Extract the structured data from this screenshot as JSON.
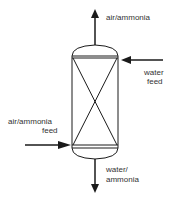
{
  "diagram": {
    "vessel": {
      "type": "packed column with crossed internals"
    },
    "streams": [
      {
        "id": "top_outlet",
        "label": "air/ammonia",
        "direction": "out",
        "position": "top"
      },
      {
        "id": "water_feed",
        "label_line1": "water",
        "label_line2": "feed",
        "direction": "in",
        "position": "upper-right"
      },
      {
        "id": "gas_feed",
        "label_line1": "air/ammonia",
        "label_line2": "feed",
        "direction": "in",
        "position": "lower-left"
      },
      {
        "id": "bottom_outlet",
        "label_line1": "water/",
        "label_line2": "ammonia",
        "direction": "out",
        "position": "bottom"
      }
    ],
    "colors": {
      "line": "#1a1a1a",
      "text": "#333333",
      "background": "#ffffff"
    }
  }
}
